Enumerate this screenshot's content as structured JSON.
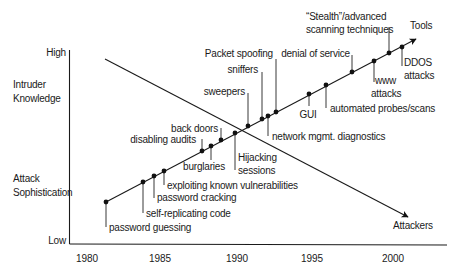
{
  "y_axis": {
    "high_label": "High",
    "low_label": "Low",
    "category_top": [
      "Intruder",
      "Knowledge"
    ],
    "category_bottom": [
      "Attack",
      "Sophistication"
    ]
  },
  "x_axis": {
    "ticks": [
      {
        "label": "1980",
        "x": 87
      },
      {
        "label": "1985",
        "x": 160
      },
      {
        "label": "1990",
        "x": 237
      },
      {
        "label": "1995",
        "x": 312
      },
      {
        "label": "2000",
        "x": 393
      }
    ]
  },
  "lines": {
    "tools": {
      "label": "Tools",
      "from": [
        106,
        202
      ],
      "to": [
        416,
        39
      ]
    },
    "attackers": {
      "label": "Attackers",
      "from": [
        105,
        59
      ],
      "to": [
        408,
        217
      ]
    }
  },
  "events": [
    {
      "label": [
        "password guessing"
      ],
      "dot": [
        106,
        202
      ],
      "leader_end": [
        106,
        227
      ],
      "text": [
        109,
        231
      ],
      "anchor": "start"
    },
    {
      "label": [
        "self-replicating code"
      ],
      "dot": [
        143,
        182
      ],
      "leader_end": [
        143,
        213
      ],
      "text": [
        146,
        217
      ],
      "anchor": "start"
    },
    {
      "label": [
        "password cracking"
      ],
      "dot": [
        154,
        176
      ],
      "leader_end": [
        154,
        198
      ],
      "text": [
        157,
        201
      ],
      "anchor": "start"
    },
    {
      "label": [
        "exploiting known vulnerabilities"
      ],
      "dot": [
        164,
        171
      ],
      "leader_end": [
        164,
        185
      ],
      "text": [
        167,
        189
      ],
      "anchor": "start"
    },
    {
      "label": [
        "disabling audits"
      ],
      "dot": [
        202,
        151
      ],
      "leader_end": [
        202,
        139
      ],
      "text": [
        196,
        143
      ],
      "anchor": "end"
    },
    {
      "label": [
        "burglaries"
      ],
      "dot": [
        211,
        146
      ],
      "leader_end": [
        211,
        160
      ],
      "text": [
        225,
        170
      ],
      "anchor": "end"
    },
    {
      "label": [
        "back doors"
      ],
      "dot": [
        221,
        140
      ],
      "leader_end": [
        221,
        128
      ],
      "text": [
        218,
        132
      ],
      "anchor": "end"
    },
    {
      "label": [
        "Hijacking",
        "sessions"
      ],
      "dot": [
        235,
        133
      ],
      "leader_end": [
        235,
        170
      ],
      "text": [
        238,
        161
      ],
      "anchor": "start"
    },
    {
      "label": [
        "sweepers"
      ],
      "dot": [
        248,
        126
      ],
      "leader_end": [
        248,
        93
      ],
      "text": [
        245,
        95
      ],
      "anchor": "end"
    },
    {
      "label": [
        "sniffers"
      ],
      "dot": [
        262,
        119
      ],
      "leader_end": [
        262,
        72
      ],
      "text": [
        258,
        73
      ],
      "anchor": "end"
    },
    {
      "label": [
        "network mgmt. diagnostics"
      ],
      "dot": [
        268,
        116
      ],
      "leader_end": [
        268,
        136
      ],
      "text": [
        272,
        140
      ],
      "anchor": "start"
    },
    {
      "label": [
        "Packet spoofing"
      ],
      "dot": [
        276,
        112
      ],
      "leader_end": [
        276,
        59
      ],
      "text": [
        273,
        57
      ],
      "anchor": "end"
    },
    {
      "label": [
        "GUI"
      ],
      "dot": [
        309,
        94
      ],
      "leader_end": [
        309,
        106
      ],
      "text": [
        308,
        118
      ],
      "anchor": "middle"
    },
    {
      "label": [
        "automated probes/scans"
      ],
      "dot": [
        326,
        85
      ],
      "leader_end": [
        326,
        108
      ],
      "text": [
        330,
        112
      ],
      "anchor": "start"
    },
    {
      "label": [
        "denial of service"
      ],
      "dot": [
        352,
        72
      ],
      "leader_end": [
        352,
        55
      ],
      "text": [
        350,
        57
      ],
      "anchor": "end"
    },
    {
      "label": [
        "www",
        "attacks"
      ],
      "dot": [
        374,
        61
      ],
      "leader_end": [
        374,
        82
      ],
      "text": [
        375,
        84
      ],
      "anchor": "start",
      "second_line_x": 371
    },
    {
      "label": [
        "“Stealth”/advanced",
        "scanning techniques"
      ],
      "dot": [
        389,
        53
      ],
      "leader_end": [
        389,
        27
      ],
      "text": [
        306,
        20
      ],
      "anchor": "start"
    },
    {
      "label": [
        "DDOS",
        "attacks"
      ],
      "dot": [
        402,
        47
      ],
      "leader_end": [
        402,
        66
      ],
      "text": [
        404,
        66
      ],
      "anchor": "start"
    }
  ]
}
